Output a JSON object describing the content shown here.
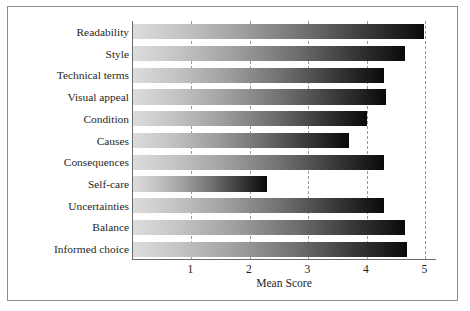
{
  "chart_data": {
    "type": "bar",
    "orientation": "horizontal",
    "title": "",
    "xlabel": "Mean Score",
    "ylabel": "",
    "xlim": [
      0,
      5.2
    ],
    "xticks": [
      1,
      2,
      3,
      4,
      5
    ],
    "xtick_labels": [
      "1",
      "2",
      "3",
      "4",
      "5"
    ],
    "grid": true,
    "grid_axis": "x",
    "grid_style": "dashed",
    "legend": false,
    "categories": [
      "Readability",
      "Style",
      "Technical terms",
      "Visual appeal",
      "Condition",
      "Causes",
      "Consequences",
      "Self-care",
      "Uncertainties",
      "Balance",
      "Informed choice"
    ],
    "values": [
      4.98,
      4.65,
      4.3,
      4.32,
      4.0,
      3.7,
      4.3,
      2.3,
      4.3,
      4.65,
      4.68
    ],
    "bar_fill": "gradient-light-to-dark",
    "bar_gradient": {
      "from": "#dcdcdc",
      "to": "#0a0a0a",
      "direction": "left-to-right"
    }
  },
  "figure": {
    "frame_color": "#8d8d8d",
    "axis_color": "#6b6b6b",
    "gridline_color": "#9a9a9a",
    "background": "#ffffff"
  }
}
